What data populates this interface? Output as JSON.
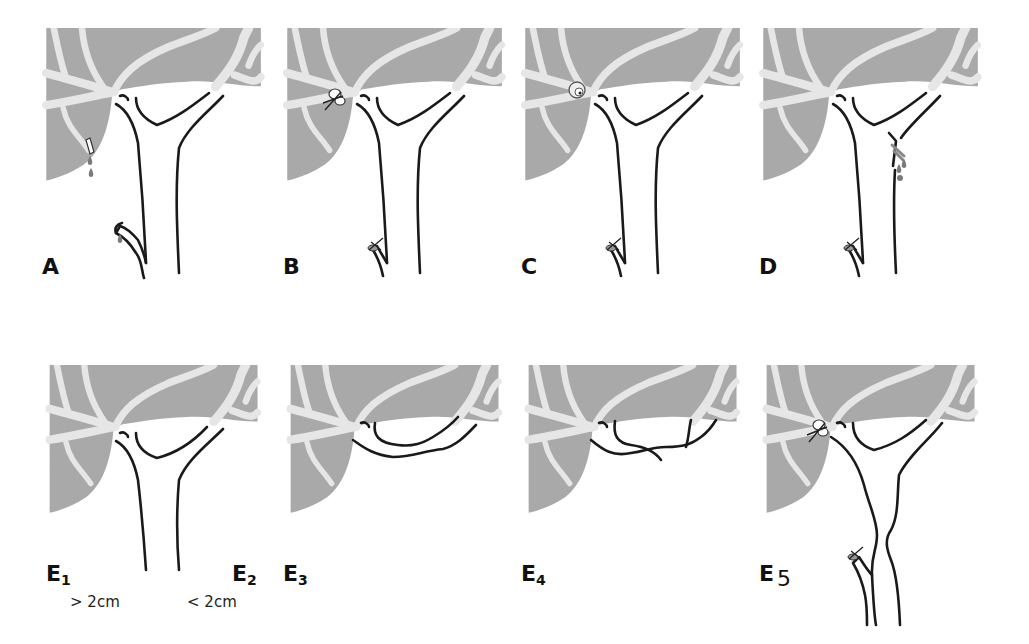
{
  "figure": {
    "colors": {
      "liver": "#a9a9a9",
      "vessels": "#e6e6e6",
      "duct_outline": "#1a1a1a",
      "bile": "#7a7a7a",
      "background": "#ffffff"
    },
    "panels": [
      {
        "id": "A",
        "label": "A",
        "injury": "cystic-duct-leak-and-accessory-duct-leak"
      },
      {
        "id": "B",
        "label": "B",
        "injury": "clipped-aberrant-right-duct"
      },
      {
        "id": "C",
        "label": "C",
        "injury": "transected-aberrant-right-duct"
      },
      {
        "id": "D",
        "label": "D",
        "injury": "lateral-injury-common-duct"
      },
      {
        "id": "E1",
        "label": "E",
        "subscript": "1",
        "note": "> 2cm",
        "injury": "transection-more-than-2cm"
      },
      {
        "id": "E2",
        "label": "E",
        "subscript": "2",
        "note": "< 2cm",
        "injury": "transection-less-than-2cm"
      },
      {
        "id": "E3",
        "label": "E",
        "subscript": "3",
        "injury": "hilar-injury-confluence-preserved"
      },
      {
        "id": "E4",
        "label": "E",
        "subscript": "4",
        "injury": "hilar-injury-confluence-destroyed"
      },
      {
        "id": "E5",
        "label": "E",
        "subscript": "5",
        "injury": "aberrant-right-duct-plus-stricture"
      }
    ]
  }
}
